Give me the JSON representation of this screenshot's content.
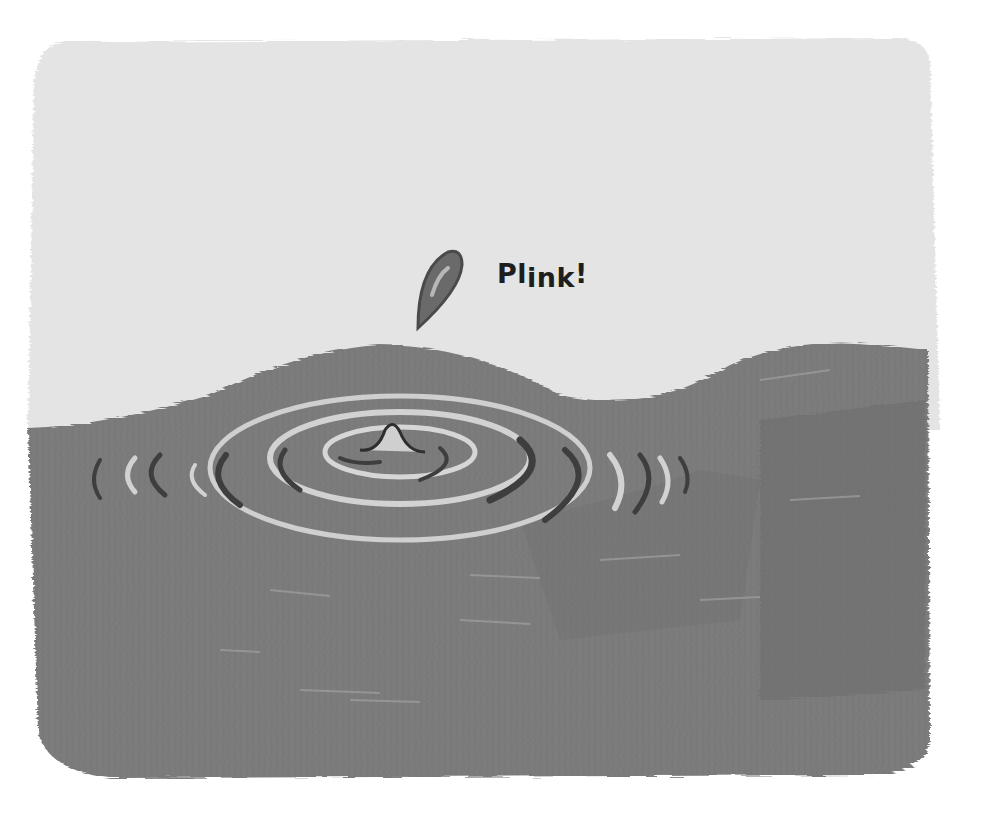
{
  "illustration": {
    "subject": "water droplet falling into a pond creating ripples",
    "sound_effect": {
      "prefix": "Pl",
      "lowered": "ink",
      "suffix": "!"
    },
    "colors": {
      "page": "#ffffff",
      "sky": "#e4e4e4",
      "water": "#7c7c7c",
      "water_dark": "#5e5e5e",
      "ripple_light": "#d2d2d2",
      "ripple_dark": "#3e3e3e",
      "droplet": "#6a6a6a",
      "text": "#1e1e1e"
    }
  }
}
